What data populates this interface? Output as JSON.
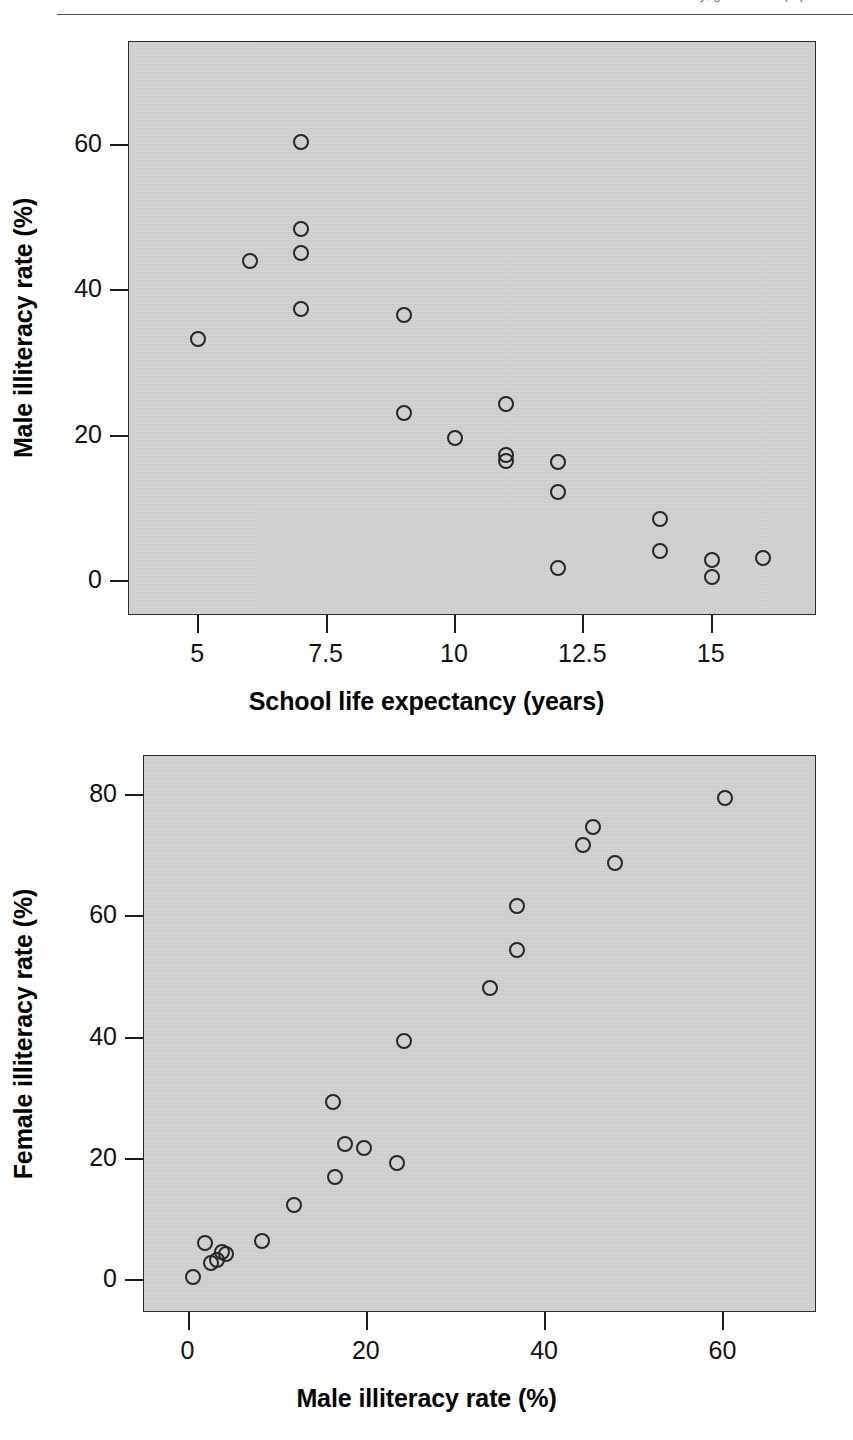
{
  "header": {
    "running_text": "Illiteracy, gender and population"
  },
  "figure_top": {
    "panel": {
      "left": 128,
      "top": 41,
      "width": 688,
      "height": 574
    },
    "bg_color": "#d2d2d2",
    "marker_color": "#262626"
  },
  "figure_bottom": {
    "panel": {
      "left": 143,
      "top": 755,
      "width": 673,
      "height": 557
    },
    "bg_color": "#d2d2d2",
    "marker_color": "#262626"
  },
  "chart_data": [
    {
      "type": "scatter",
      "title": "",
      "xlabel": "School life expectancy (years)",
      "ylabel": "Male illiteracy rate (%)",
      "xlim": [
        3.65,
        17.05
      ],
      "ylim": [
        -4.8,
        74.2
      ],
      "xticks": [
        5,
        7.5,
        10,
        12.5,
        15
      ],
      "xticklabels": [
        "5",
        "7.5",
        "10",
        "12.5",
        "15"
      ],
      "yticks": [
        0,
        20,
        40,
        60
      ],
      "yticklabels": [
        "0",
        "20",
        "40",
        "60"
      ],
      "grid": false,
      "legend": false,
      "points": [
        {
          "x": 5.0,
          "y": 33.3
        },
        {
          "x": 6.0,
          "y": 44.0
        },
        {
          "x": 7.0,
          "y": 60.4
        },
        {
          "x": 7.0,
          "y": 48.5
        },
        {
          "x": 7.0,
          "y": 45.1
        },
        {
          "x": 7.0,
          "y": 37.4
        },
        {
          "x": 9.0,
          "y": 36.6
        },
        {
          "x": 9.0,
          "y": 23.1
        },
        {
          "x": 10.0,
          "y": 19.7
        },
        {
          "x": 11.0,
          "y": 24.4
        },
        {
          "x": 11.0,
          "y": 17.4
        },
        {
          "x": 11.0,
          "y": 16.6
        },
        {
          "x": 12.0,
          "y": 16.4
        },
        {
          "x": 12.0,
          "y": 12.3
        },
        {
          "x": 12.0,
          "y": 1.8
        },
        {
          "x": 14.0,
          "y": 8.6
        },
        {
          "x": 14.0,
          "y": 4.1
        },
        {
          "x": 15.0,
          "y": 2.9
        },
        {
          "x": 15.0,
          "y": 0.5
        },
        {
          "x": 16.0,
          "y": 3.2
        }
      ]
    },
    {
      "type": "scatter",
      "title": "",
      "xlabel": "Male illiteracy rate (%)",
      "ylabel": "Female illiteracy rate (%)",
      "xlim": [
        -5.0,
        70.5
      ],
      "ylim": [
        -5.5,
        86.5
      ],
      "xticks": [
        0,
        20,
        40,
        60
      ],
      "xticklabels": [
        "0",
        "20",
        "40",
        "60"
      ],
      "yticks": [
        0,
        20,
        40,
        60,
        80
      ],
      "yticklabels": [
        "0",
        "20",
        "40",
        "60",
        "80"
      ],
      "grid": false,
      "legend": false,
      "points": [
        {
          "x": 0.5,
          "y": 0.4
        },
        {
          "x": 1.8,
          "y": 6.0
        },
        {
          "x": 2.5,
          "y": 2.7
        },
        {
          "x": 3.2,
          "y": 3.3
        },
        {
          "x": 3.8,
          "y": 4.5
        },
        {
          "x": 4.2,
          "y": 4.3
        },
        {
          "x": 8.2,
          "y": 6.4
        },
        {
          "x": 11.8,
          "y": 12.4
        },
        {
          "x": 16.2,
          "y": 29.4
        },
        {
          "x": 16.4,
          "y": 17.0
        },
        {
          "x": 17.6,
          "y": 22.4
        },
        {
          "x": 19.7,
          "y": 21.7
        },
        {
          "x": 23.4,
          "y": 19.3
        },
        {
          "x": 24.2,
          "y": 39.4
        },
        {
          "x": 33.8,
          "y": 48.2
        },
        {
          "x": 36.8,
          "y": 61.8
        },
        {
          "x": 36.9,
          "y": 54.4
        },
        {
          "x": 44.2,
          "y": 71.8
        },
        {
          "x": 45.4,
          "y": 74.7
        },
        {
          "x": 47.8,
          "y": 68.9
        },
        {
          "x": 60.2,
          "y": 79.6
        }
      ]
    }
  ]
}
